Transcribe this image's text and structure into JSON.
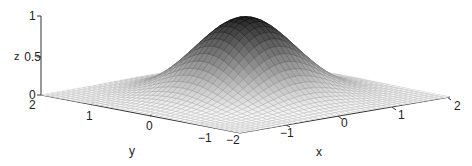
{
  "chart_data": {
    "type": "surface",
    "title": "",
    "function": "z = exp(-(x^2 + y^2))",
    "xlabel": "x",
    "ylabel": "y",
    "zlabel": "z",
    "xlim": [
      -2,
      2
    ],
    "ylim": [
      -2,
      2
    ],
    "zlim": [
      0,
      1
    ],
    "x_ticks": [
      "-2",
      "-1",
      "0",
      "1",
      "2"
    ],
    "y_ticks": [
      "-1",
      "0",
      "1",
      "2"
    ],
    "z_ticks": [
      "0",
      "0.5",
      "1"
    ],
    "grid_points": 41,
    "colormap": "gray",
    "peak": {
      "x": 0,
      "y": 0,
      "z": 1
    }
  },
  "labels": {
    "z": {
      "t0": "0",
      "t05": "0.5",
      "t1": "1",
      "name": "z"
    },
    "y": {
      "t2": "2",
      "t1": "1",
      "t0": "0",
      "tm1": "−1",
      "name": "y"
    },
    "x": {
      "tm2": "−2",
      "tm1": "−1",
      "t0": "0",
      "t1": "1",
      "t2": "2",
      "name": "x"
    }
  }
}
